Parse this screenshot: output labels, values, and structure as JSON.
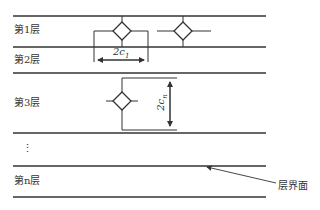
{
  "diagram": {
    "layers": [
      {
        "label": "第1层"
      },
      {
        "label": "第2层"
      },
      {
        "label": "第3层"
      },
      {
        "label": "⋮"
      },
      {
        "label": "第n层"
      }
    ],
    "dimensions": {
      "horizontal": "2c",
      "horizontal_sub": "1",
      "vertical": "2c",
      "vertical_sub": "n"
    },
    "annotation": "层界面",
    "colors": {
      "line": "#333333",
      "background": "#ffffff"
    }
  }
}
